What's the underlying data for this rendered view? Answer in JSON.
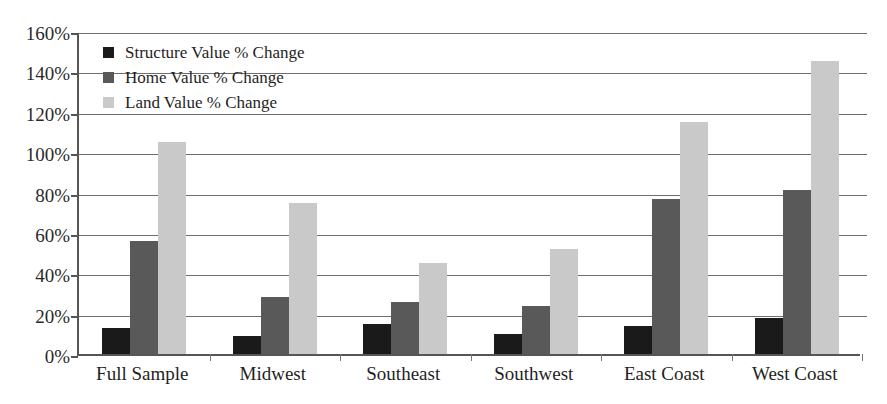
{
  "chart_data": {
    "type": "bar",
    "title": "",
    "xlabel": "",
    "ylabel": "",
    "ylim": [
      0,
      160
    ],
    "ytick_step": 20,
    "ytick_labels": [
      "0%",
      "20%",
      "40%",
      "60%",
      "80%",
      "100%",
      "120%",
      "140%",
      "160%"
    ],
    "ytick_values": [
      0,
      20,
      40,
      60,
      80,
      100,
      120,
      140,
      160
    ],
    "value_unit": "%",
    "grid": true,
    "grid_axis": "y",
    "legend_position": "top-left-inside",
    "categories": [
      "Full Sample",
      "Midwest",
      "Southeast",
      "Southwest",
      "East Coast",
      "West Coast"
    ],
    "series": [
      {
        "name": "Structure Value % Change",
        "color": "#1a1a1a",
        "values": [
          13,
          9,
          15,
          10,
          14,
          18
        ]
      },
      {
        "name": "Home Value % Change",
        "color": "#595959",
        "values": [
          56,
          28,
          26,
          24,
          77,
          81
        ]
      },
      {
        "name": "Land Value % Change",
        "color": "#c9c9c9",
        "values": [
          105,
          75,
          45,
          52,
          115,
          145
        ]
      }
    ]
  },
  "legend": {
    "items": [
      {
        "label": "Structure Value % Change",
        "swatch": "legend-swatch-structure"
      },
      {
        "label": "Home Value % Change",
        "swatch": "legend-swatch-home"
      },
      {
        "label": "Land Value % Change",
        "swatch": "legend-swatch-land"
      }
    ]
  },
  "axes": {
    "y": {
      "ticks": [
        "160%",
        "140%",
        "120%",
        "100%",
        "80%",
        "60%",
        "40%",
        "20%",
        "0%"
      ]
    },
    "x": {
      "ticks": [
        "Full Sample",
        "Midwest",
        "Southeast",
        "Southwest",
        "East Coast",
        "West Coast"
      ]
    }
  }
}
